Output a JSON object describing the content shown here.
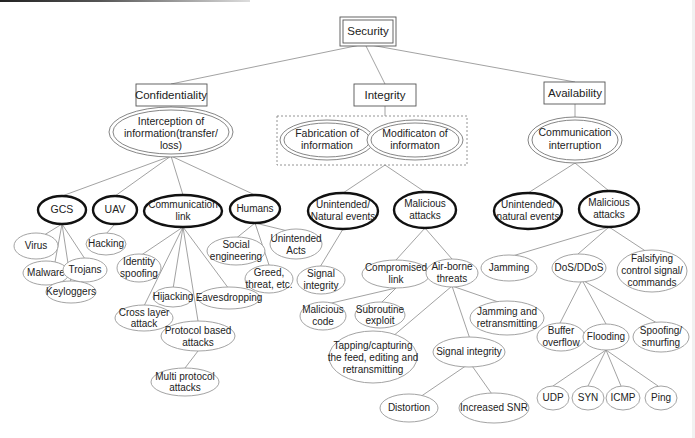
{
  "diagram": {
    "type": "tree",
    "root": "Security",
    "pillars": {
      "confidentiality": "Confidentiality",
      "integrity": "Integrity",
      "availability": "Availability"
    },
    "threats": {
      "interception": [
        "Interception of",
        "information(transfer/",
        "loss)"
      ],
      "fabrication": [
        "Fabrication of",
        "information"
      ],
      "modification": [
        "Modificaton of",
        "informaton"
      ],
      "interruption": [
        "Communication",
        "interruption"
      ]
    },
    "confidentiality_targets": {
      "gcs": "GCS",
      "uav": "UAV",
      "comm_link": [
        "Communication",
        "link"
      ],
      "humans": "Humans"
    },
    "integrity_causes": {
      "unintended": [
        "Unintended/",
        "Natural events"
      ],
      "malicious": [
        "Malicious",
        "attacks"
      ]
    },
    "availability_causes": {
      "unintended": [
        "Unintended/",
        "natural events"
      ],
      "malicious": [
        "Malicious",
        "attacks"
      ]
    },
    "gcs_children": {
      "virus": "Virus",
      "malware": "Malware",
      "trojans": "Trojans",
      "keyloggers": "Keyloggers"
    },
    "uav_children": {
      "hacking": "Hacking"
    },
    "comm_link_children": {
      "identity_spoofing": [
        "Identity",
        "spoofing"
      ],
      "hijacking": "Hijacking",
      "eavesdropping": "Eavesdropping",
      "cross_layer": [
        "Cross layer",
        "attack"
      ],
      "protocol_based": [
        "Protocol based",
        "attacks"
      ],
      "multi_protocol": [
        "Multi protocol",
        "attacks"
      ]
    },
    "humans_children": {
      "social": [
        "Social",
        "engineering"
      ],
      "unintended_acts": [
        "Unintended",
        "Acts"
      ],
      "greed": [
        "Greed,",
        "threat, etc."
      ]
    },
    "integrity_unintended_children": {
      "signal_integrity": [
        "Signal",
        "integrity"
      ]
    },
    "integrity_malicious_children": {
      "compromised_link": [
        "Compromised",
        "link"
      ],
      "airborne": [
        "Air-borne",
        "threats"
      ],
      "malicious_code": [
        "Malicious",
        "code"
      ],
      "subroutine": [
        "Subroutine",
        "exploit"
      ],
      "jam_retx": [
        "Jamming and",
        "retransmitting"
      ],
      "tapping": [
        "Tapping/capturing",
        "the feed, editing and",
        "retransmitting"
      ],
      "signal_integrity": "Signal integrity",
      "distortion": "Distortion",
      "increased_snr": "Increased SNR"
    },
    "availability_malicious_children": {
      "jamming": "Jamming",
      "dos": "DoS/DDoS",
      "falsifying": [
        "Falsifying",
        "control signal/",
        "commands"
      ],
      "buffer": [
        "Buffer",
        "overflow"
      ],
      "flooding": "Flooding",
      "spoofing": [
        "Spoofing/",
        "smurfing"
      ],
      "udp": "UDP",
      "syn": "SYN",
      "icmp": "ICMP",
      "ping": "Ping"
    }
  }
}
